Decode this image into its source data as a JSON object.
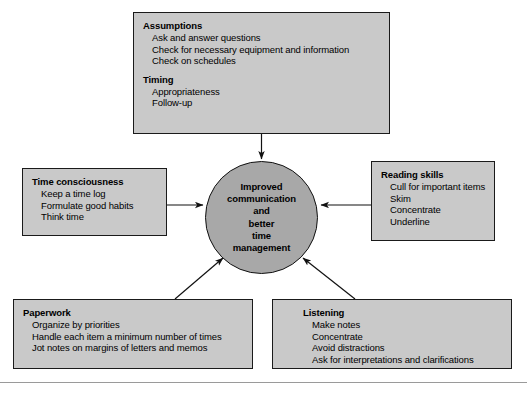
{
  "diagram": {
    "type": "hub-and-spoke",
    "center": {
      "label": "Improved communication and better time management",
      "lines": [
        "Improved",
        "communication",
        "and",
        "better",
        "time",
        "management"
      ],
      "shape": "circle",
      "fill": "#a8a8a8",
      "stroke": "#111111"
    },
    "boxes": [
      {
        "id": "assumptions",
        "position": "top",
        "arrow": "down-into-center",
        "groups": [
          {
            "title": "Assumptions",
            "items": [
              "Ask and answer questions",
              "Check for necessary equipment and information",
              "Check on schedules"
            ]
          },
          {
            "title": "Timing",
            "items": [
              "Appropriateness",
              "Follow-up"
            ]
          }
        ]
      },
      {
        "id": "time-consciousness",
        "position": "left",
        "arrow": "right-into-center",
        "groups": [
          {
            "title": "Time consciousness",
            "items": [
              "Keep a time log",
              "Formulate good habits",
              "Think time"
            ]
          }
        ]
      },
      {
        "id": "reading-skills",
        "position": "right",
        "arrow": "left-into-center",
        "groups": [
          {
            "title": "Reading skills",
            "items": [
              "Cull for important items",
              "Skim",
              "Concentrate",
              "Underline"
            ]
          }
        ]
      },
      {
        "id": "paperwork",
        "position": "bottom-left",
        "arrow": "up-right-into-center",
        "groups": [
          {
            "title": "Paperwork",
            "items": [
              "Organize by priorities",
              "Handle each item a minimum number of times",
              "Jot notes on margins of letters and memos"
            ]
          }
        ]
      },
      {
        "id": "listening",
        "position": "bottom-right",
        "arrow": "up-left-into-center",
        "groups": [
          {
            "title": "Listening",
            "items": [
              "Make notes",
              "Concentrate",
              "Avoid distractions",
              "Ask for interpretations and clarifications"
            ]
          }
        ]
      }
    ],
    "colors": {
      "box_fill": "#c9c9c9",
      "box_stroke": "#1a1a1a",
      "circle_fill": "#a8a8a8",
      "connector": "#111111",
      "rule": "#9a9a9a",
      "background": "#ffffff"
    }
  }
}
